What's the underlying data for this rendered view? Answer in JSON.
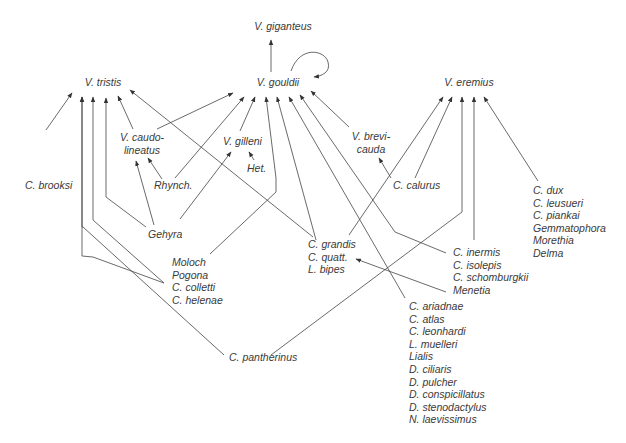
{
  "diagram": {
    "type": "directed-graph",
    "line_color": "#444444",
    "text_color": "#3a3a3a",
    "background": "#ffffff",
    "nodes": {
      "v_giganteus": {
        "lines": [
          "V. giganteus"
        ]
      },
      "v_gouldii": {
        "lines": [
          "V. gouldii"
        ]
      },
      "v_tristis": {
        "lines": [
          "V. tristis"
        ]
      },
      "v_eremius": {
        "lines": [
          "V. eremius"
        ]
      },
      "v_caudolineatus": {
        "lines": [
          "V. caudo-",
          "lineatus"
        ]
      },
      "v_gilleni": {
        "lines": [
          "V. gilleni"
        ]
      },
      "v_brevicauda": {
        "lines": [
          "V. brevi-",
          "cauda"
        ]
      },
      "c_brooksi": {
        "lines": [
          "C. brooksi"
        ]
      },
      "rhynch": {
        "lines": [
          "Rhynch."
        ]
      },
      "het": {
        "lines": [
          "Het."
        ]
      },
      "c_calurus": {
        "lines": [
          "C. calurus"
        ]
      },
      "gehyra": {
        "lines": [
          "Gehyra"
        ]
      },
      "moloch_group": {
        "lines": [
          "Moloch",
          "Pogona",
          "C. colletti",
          "C. helenae"
        ]
      },
      "grandis_group": {
        "lines": [
          "C. grandis",
          "C. quatt.",
          "L. bipes"
        ]
      },
      "inermis_group": {
        "lines": [
          "C. inermis",
          "C. isolepis",
          "C. schomburgkii",
          "Menetia"
        ]
      },
      "dux_group": {
        "lines": [
          "C. dux",
          "C. leusueri",
          "C. piankai",
          "Gemmatophora",
          "Morethia",
          "Delma"
        ]
      },
      "ariadnae_group": {
        "lines": [
          "C. ariadnae",
          "C. atlas",
          "C. leonhardi",
          "L. muelleri",
          "Lialis",
          "D. ciliaris",
          "D. pulcher",
          "D. conspicillatus",
          "D. stenodactylus",
          "N. laevissimus"
        ]
      },
      "c_pantherinus": {
        "lines": [
          "C. pantherinus"
        ]
      }
    },
    "edges": [
      {
        "from": "v_gouldii",
        "to": "v_giganteus",
        "path": "M271,72 L271,40"
      },
      {
        "from": "v_gouldii",
        "to": "v_gouldii",
        "path": "M291,71 C300,45 325,50 328,62 C331,72 322,76 314,77"
      },
      {
        "from": "c_brooksi",
        "to": "v_tristis",
        "path": "M46,130 L72,93"
      },
      {
        "from": "moloch_group",
        "to": "v_tristis",
        "path": "M164,283 L93,257 L82,256 L82,97"
      },
      {
        "from": "c_pantherinus",
        "to": "v_tristis",
        "path": "M224,355 L83,227 L82,227 L82,97"
      },
      {
        "from": "moloch_group",
        "to": "v_tristis",
        "path": "M164,283 L93,220 L93,97"
      },
      {
        "from": "gehyra",
        "to": "v_tristis",
        "path": "M146,227 L106,197 L106,98"
      },
      {
        "from": "v_caudolineatus",
        "to": "v_tristis",
        "path": "M133,129 L118,96"
      },
      {
        "from": "grandis_group",
        "to": "v_tristis",
        "path": "M313,237 L130,90"
      },
      {
        "from": "v_caudolineatus",
        "to": "v_gouldii",
        "path": "M157,129 L233,93"
      },
      {
        "from": "gehyra",
        "to": "v_caudolineatus",
        "path": "M154,225 L136,161"
      },
      {
        "from": "rhynch",
        "to": "v_caudolineatus",
        "path": "M162,179 L148,158"
      },
      {
        "from": "rhynch",
        "to": "v_gouldii",
        "path": "M175,178 L244,97"
      },
      {
        "from": "gehyra",
        "to": "v_gilleni",
        "path": "M180,219 L231,152"
      },
      {
        "from": "v_gilleni",
        "to": "v_gouldii",
        "path": "M240,131 L255,97"
      },
      {
        "from": "het",
        "to": "v_gilleni",
        "path": "M254,160 L249,152"
      },
      {
        "from": "moloch_group",
        "to": "v_gouldii",
        "path": "M210,254 L276,192 L276,178 L266,97"
      },
      {
        "from": "grandis_group",
        "to": "v_gouldii",
        "path": "M316,240 L277,97"
      },
      {
        "from": "ariadnae_group",
        "to": "v_gouldii",
        "path": "M405,298 L289,97"
      },
      {
        "from": "inermis_group",
        "to": "v_gouldii",
        "path": "M446,253 L395,232 L300,95"
      },
      {
        "from": "v_brevicauda",
        "to": "v_gouldii",
        "path": "M349,127 L311,91"
      },
      {
        "from": "c_calurus",
        "to": "v_brevicauda",
        "path": "M391,178 L379,158"
      },
      {
        "from": "grandis_group",
        "to": "v_eremius",
        "path": "M349,235 L443,97"
      },
      {
        "from": "c_calurus",
        "to": "v_eremius",
        "path": "M415,178 L452,97"
      },
      {
        "from": "c_pantherinus",
        "to": "v_eremius",
        "path": "M271,355 L462,212 L462,97"
      },
      {
        "from": "inermis_group",
        "to": "v_eremius",
        "path": "M474,240 L474,97"
      },
      {
        "from": "dux_group",
        "to": "v_eremius",
        "path": "M538,181 L484,97"
      },
      {
        "from": "inermis_group",
        "to": "grandis_group",
        "path": "M446,292 L356,259"
      }
    ]
  }
}
